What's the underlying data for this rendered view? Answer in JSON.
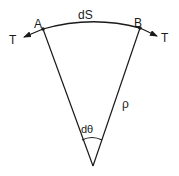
{
  "diagram": {
    "labels": {
      "point_a": "A",
      "point_b": "B",
      "arc_length": "dS",
      "tension_left": "T",
      "tension_right": "T",
      "radius": "ρ",
      "angle": "dθ"
    },
    "colors": {
      "stroke": "#1a1a1a",
      "background": "#ffffff"
    }
  }
}
